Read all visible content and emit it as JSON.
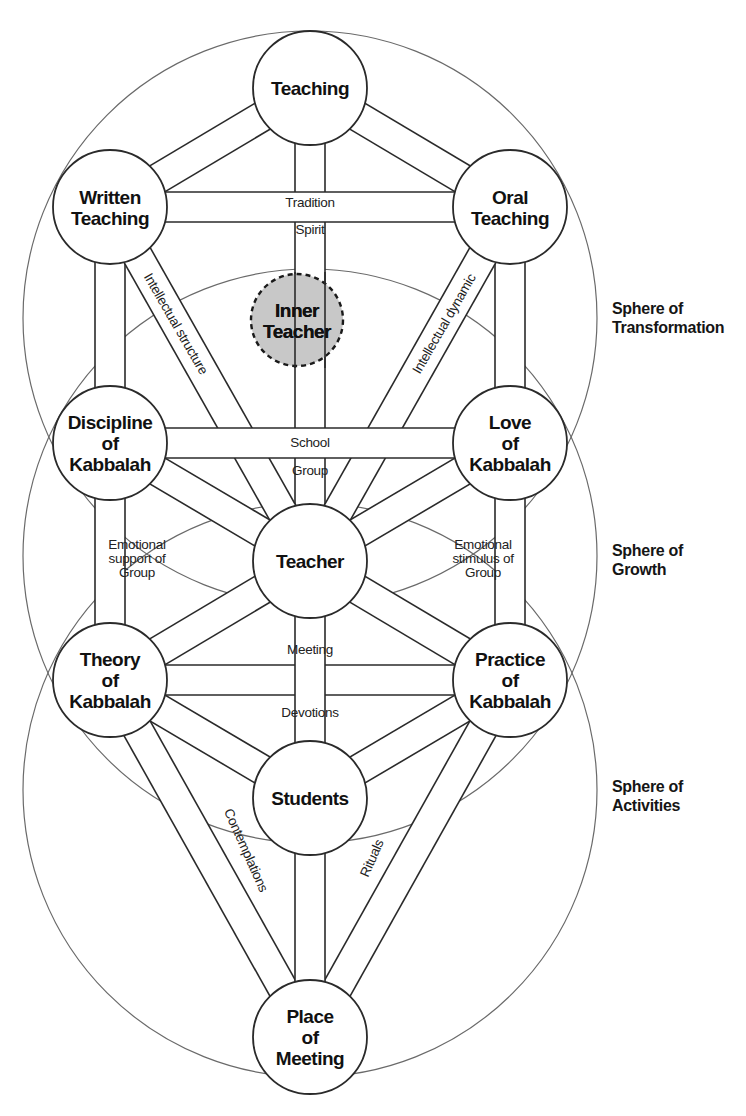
{
  "diagram": {
    "type": "tree-of-life-kabbalah-school",
    "spheres": [
      {
        "id": "transformation",
        "cx": 310,
        "cy": 318,
        "r": 287,
        "label_lines": [
          "Sphere of",
          "Transformation"
        ],
        "label_x": 612,
        "label_y": 314
      },
      {
        "id": "growth",
        "cx": 310,
        "cy": 556,
        "r": 287,
        "label_lines": [
          "Sphere of",
          "Growth"
        ],
        "label_x": 612,
        "label_y": 556
      },
      {
        "id": "activities",
        "cx": 310,
        "cy": 790,
        "r": 287,
        "label_lines": [
          "Sphere of",
          "Activities"
        ],
        "label_x": 612,
        "label_y": 792
      }
    ],
    "nodes": [
      {
        "id": "teaching",
        "cx": 310,
        "cy": 88,
        "r": 57,
        "label_lines": [
          "Teaching"
        ],
        "style": "normal"
      },
      {
        "id": "written-teaching",
        "cx": 110,
        "cy": 207,
        "r": 57,
        "label_lines": [
          "Written",
          "Teaching"
        ],
        "style": "normal"
      },
      {
        "id": "oral-teaching",
        "cx": 510,
        "cy": 207,
        "r": 57,
        "label_lines": [
          "Oral",
          "Teaching"
        ],
        "style": "normal"
      },
      {
        "id": "inner-teacher",
        "cx": 297,
        "cy": 320,
        "r": 46,
        "label_lines": [
          "Inner",
          "Teacher"
        ],
        "style": "inner"
      },
      {
        "id": "discipline-of-kabbalah",
        "cx": 110,
        "cy": 443,
        "r": 57,
        "label_lines": [
          "Discipline",
          "of",
          "Kabbalah"
        ],
        "style": "normal"
      },
      {
        "id": "love-of-kabbalah",
        "cx": 510,
        "cy": 443,
        "r": 57,
        "label_lines": [
          "Love",
          "of",
          "Kabbalah"
        ],
        "style": "normal"
      },
      {
        "id": "teacher",
        "cx": 310,
        "cy": 561,
        "r": 57,
        "label_lines": [
          "Teacher"
        ],
        "style": "normal"
      },
      {
        "id": "theory-of-kabbalah",
        "cx": 110,
        "cy": 680,
        "r": 57,
        "label_lines": [
          "Theory",
          "of",
          "Kabbalah"
        ],
        "style": "normal"
      },
      {
        "id": "practice-of-kabbalah",
        "cx": 510,
        "cy": 680,
        "r": 57,
        "label_lines": [
          "Practice",
          "of",
          "Kabbalah"
        ],
        "style": "normal"
      },
      {
        "id": "students",
        "cx": 310,
        "cy": 798,
        "r": 57,
        "label_lines": [
          "Students"
        ],
        "style": "normal"
      },
      {
        "id": "place-of-meeting",
        "cx": 310,
        "cy": 1037,
        "r": 57,
        "label_lines": [
          "Place",
          "of",
          "Meeting"
        ],
        "style": "normal"
      }
    ],
    "paths": [
      {
        "from": "teaching",
        "to": "written-teaching",
        "width": 30
      },
      {
        "from": "teaching",
        "to": "oral-teaching",
        "width": 30
      },
      {
        "from": "teaching",
        "to": "teacher",
        "width": 30
      },
      {
        "from": "written-teaching",
        "to": "oral-teaching",
        "width": 30
      },
      {
        "from": "written-teaching",
        "to": "discipline-of-kabbalah",
        "width": 30
      },
      {
        "from": "oral-teaching",
        "to": "love-of-kabbalah",
        "width": 30
      },
      {
        "from": "written-teaching",
        "to": "teacher",
        "width": 30
      },
      {
        "from": "oral-teaching",
        "to": "teacher",
        "width": 30
      },
      {
        "from": "discipline-of-kabbalah",
        "to": "love-of-kabbalah",
        "width": 30
      },
      {
        "from": "discipline-of-kabbalah",
        "to": "teacher",
        "width": 30
      },
      {
        "from": "love-of-kabbalah",
        "to": "teacher",
        "width": 30
      },
      {
        "from": "discipline-of-kabbalah",
        "to": "theory-of-kabbalah",
        "width": 30
      },
      {
        "from": "love-of-kabbalah",
        "to": "practice-of-kabbalah",
        "width": 30
      },
      {
        "from": "theory-of-kabbalah",
        "to": "teacher",
        "width": 30
      },
      {
        "from": "practice-of-kabbalah",
        "to": "teacher",
        "width": 30
      },
      {
        "from": "theory-of-kabbalah",
        "to": "practice-of-kabbalah",
        "width": 30
      },
      {
        "from": "teacher",
        "to": "students",
        "width": 30
      },
      {
        "from": "theory-of-kabbalah",
        "to": "students",
        "width": 30
      },
      {
        "from": "practice-of-kabbalah",
        "to": "students",
        "width": 30
      },
      {
        "from": "theory-of-kabbalah",
        "to": "place-of-meeting",
        "width": 30
      },
      {
        "from": "practice-of-kabbalah",
        "to": "place-of-meeting",
        "width": 30
      },
      {
        "from": "students",
        "to": "place-of-meeting",
        "width": 30
      }
    ],
    "path_labels": [
      {
        "id": "tradition",
        "text": "Tradition",
        "x": 310,
        "y": 207,
        "rotate": 0,
        "anchor": "middle"
      },
      {
        "id": "spirit",
        "text": "Spirit",
        "x": 310,
        "y": 234,
        "rotate": 0,
        "anchor": "middle"
      },
      {
        "id": "intellectual-structure",
        "text": "Intellectual structure",
        "x": 172,
        "y": 326,
        "rotate": 60,
        "anchor": "middle"
      },
      {
        "id": "intellectual-dynamic",
        "text": "Intellectual dynamic",
        "x": 448,
        "y": 326,
        "rotate": -60,
        "anchor": "middle"
      },
      {
        "id": "school",
        "text": "School",
        "x": 310,
        "y": 447,
        "rotate": 0,
        "anchor": "middle"
      },
      {
        "id": "group",
        "text": "Group",
        "x": 310,
        "y": 475,
        "rotate": 0,
        "anchor": "middle"
      }
    ],
    "multi_labels": [
      {
        "id": "emotional-support-of-group",
        "lines": [
          "Emotional",
          "support of",
          "Group"
        ],
        "x": 137,
        "y": 549,
        "anchor": "start"
      },
      {
        "id": "emotional-stimulus-of-group",
        "lines": [
          "Emotional",
          "stimulus of",
          "Group"
        ],
        "x": 483,
        "y": 549,
        "anchor": "end"
      }
    ],
    "path_labels_lower": [
      {
        "id": "meeting",
        "text": "Meeting",
        "x": 310,
        "y": 654,
        "rotate": 0,
        "anchor": "middle"
      },
      {
        "id": "devotions",
        "text": "Devotions",
        "x": 310,
        "y": 717,
        "rotate": 0,
        "anchor": "middle"
      },
      {
        "id": "contemplations",
        "text": "Contemplations",
        "x": 242,
        "y": 852,
        "rotate": 66,
        "anchor": "middle"
      },
      {
        "id": "rituals",
        "text": "Rituals",
        "x": 376,
        "y": 860,
        "rotate": -66,
        "anchor": "middle"
      }
    ],
    "colors": {
      "node_stroke": "#2a2a2a",
      "inner_teacher_fill": "#c8c8c8",
      "sphere_stroke": "#6a6a6a",
      "background": "#ffffff"
    }
  }
}
